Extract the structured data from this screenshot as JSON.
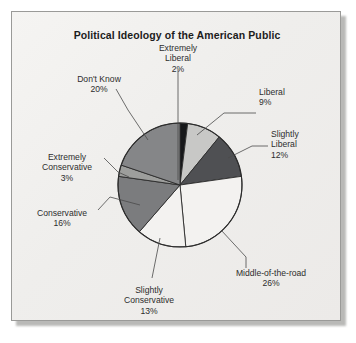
{
  "figure": {
    "title": "Political Ideology of the American Public",
    "background_color": "#f1f0ee",
    "frame_color": "#9a9a98"
  },
  "chart_data": {
    "type": "pie",
    "title": "Political Ideology of the American Public",
    "xlabel": "",
    "ylabel": "",
    "unit": "percent",
    "legend_position": "none",
    "labels_position": "outside-with-leader-lines",
    "start_angle_deg": 0,
    "direction": "clockwise",
    "categories": [
      "Extremely Liberal",
      "Liberal",
      "Slightly Liberal",
      "Middle-of-the-road",
      "Slightly Conservative",
      "Conservative",
      "Extremely Conservative",
      "Don't Know"
    ],
    "values": [
      2,
      9,
      12,
      26,
      13,
      16,
      3,
      20
    ],
    "total": 101,
    "slices": [
      {
        "label": "Extremely Liberal",
        "label_line1": "Extremely",
        "label_line2": "Liberal",
        "value": 2,
        "percent_text": "2%",
        "color": "#17181a",
        "label_x": 141,
        "label_y": 43,
        "label_width": 74,
        "label_align": "center"
      },
      {
        "label": "Liberal",
        "label_line1": "Liberal",
        "label_line2": "",
        "value": 9,
        "percent_text": "9%",
        "color": "#c8c8c6",
        "label_x": 259,
        "label_y": 87,
        "label_width": 64,
        "label_align": "left"
      },
      {
        "label": "Slightly Liberal",
        "label_line1": "Slightly",
        "label_line2": "Liberal",
        "value": 12,
        "percent_text": "12%",
        "color": "#4f5053",
        "label_x": 271,
        "label_y": 129,
        "label_width": 56,
        "label_align": "left"
      },
      {
        "label": "Middle-of-the-road",
        "label_line1": "Middle-of-the-road",
        "label_line2": "",
        "value": 26,
        "percent_text": "26%",
        "color": "#f3f2f0",
        "label_x": 223,
        "label_y": 268,
        "label_width": 96,
        "label_align": "center"
      },
      {
        "label": "Slightly Conservative",
        "label_line1": "Slightly",
        "label_line2": "Conservative",
        "value": 13,
        "percent_text": "13%",
        "color": "#f3f2f0",
        "label_x": 106,
        "label_y": 285,
        "label_width": 86,
        "label_align": "center"
      },
      {
        "label": "Conservative",
        "label_line1": "Conservative",
        "label_line2": "",
        "value": 16,
        "percent_text": "16%",
        "color": "#7b7c7e",
        "label_x": 24,
        "label_y": 208,
        "label_width": 76,
        "label_align": "center"
      },
      {
        "label": "Extremely Conservative",
        "label_line1": "Extremely",
        "label_line2": "Conservative",
        "value": 3,
        "percent_text": "3%",
        "color": "#9d9e9c",
        "label_x": 27,
        "label_y": 152,
        "label_width": 80,
        "label_align": "center"
      },
      {
        "label": "Don't Know",
        "label_line1": "Don't Know",
        "label_line2": "",
        "value": 20,
        "percent_text": "20%",
        "color": "#858688",
        "label_x": 58,
        "label_y": 74,
        "label_width": 82,
        "label_align": "center"
      }
    ],
    "geometry": {
      "center_x": 180,
      "center_y": 185,
      "radius": 62
    },
    "leader_lines": [
      {
        "name": "extremely-liberal",
        "points": "178,180 178,70"
      },
      {
        "name": "liberal",
        "points": "197,135 224,113 256,113"
      },
      {
        "name": "slightly-liberal",
        "points": "228,158 252,146 268,146"
      },
      {
        "name": "middle-of-the-road",
        "points": "221,230 246,257 246,268"
      },
      {
        "name": "slightly-conservative",
        "points": "160,238 152,278"
      },
      {
        "name": "conservative",
        "points": "140,205 110,197 98,210"
      },
      {
        "name": "extremely-conservative",
        "points": "129,177 118,172 104,158"
      },
      {
        "name": "dont-know",
        "points": "148,140 128,110 116,89"
      }
    ]
  }
}
